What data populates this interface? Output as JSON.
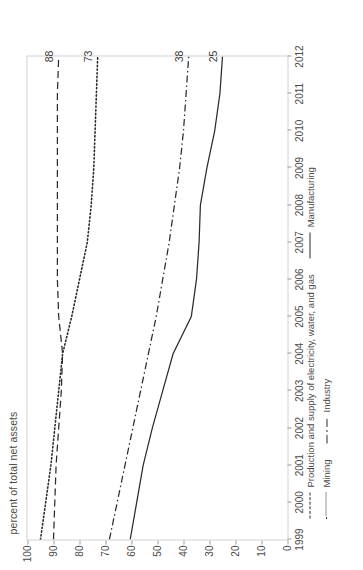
{
  "chart_data": {
    "type": "line",
    "title": "",
    "subtitle": "",
    "xlabel": "",
    "ylabel": "percent of total net assets",
    "x": [
      1999,
      2000,
      2001,
      2002,
      2003,
      2004,
      2005,
      2006,
      2007,
      2008,
      2009,
      2010,
      2011,
      2012
    ],
    "xtick_labels": [
      "1999",
      "2000",
      "2001",
      "2002",
      "2003",
      "2004",
      "2005",
      "2006",
      "2007",
      "2008",
      "2009",
      "2010",
      "2011",
      "2012"
    ],
    "ylim": [
      0,
      100
    ],
    "ytick_labels": [
      "0",
      "10",
      "20",
      "30",
      "40",
      "50",
      "60",
      "70",
      "80",
      "90",
      "100"
    ],
    "ytick_values": [
      0,
      10,
      20,
      30,
      40,
      50,
      60,
      70,
      80,
      90,
      100
    ],
    "grid": false,
    "legend_position": "bottom",
    "series": [
      {
        "name": "Production and supply of electricity, water, and gas",
        "style": "dashed",
        "color": "#2b2b2b",
        "end_label": "88",
        "values": [
          90,
          89.5,
          89,
          88,
          87,
          86.5,
          88,
          88.5,
          88.5,
          88.5,
          88.5,
          88.5,
          88.5,
          88
        ]
      },
      {
        "name": "Mining",
        "style": "dotted",
        "color": "#2b2b2b",
        "end_label": "73",
        "values": [
          95,
          93,
          91,
          89.5,
          88,
          86.5,
          83,
          80,
          77,
          75.5,
          74.5,
          74,
          73.5,
          73
        ]
      },
      {
        "name": "Industry",
        "style": "dash-dot",
        "color": "#2b2b2b",
        "end_label": "38",
        "values": [
          68.5,
          65.5,
          62.5,
          59.5,
          56.5,
          53.5,
          50.5,
          48,
          45.5,
          43.5,
          41.5,
          40,
          39,
          38
        ]
      },
      {
        "name": "Manufacturing",
        "style": "solid",
        "color": "#2b2b2b",
        "end_label": "25",
        "values": [
          60.5,
          58,
          55.5,
          52,
          48,
          44,
          37,
          35,
          34,
          33.5,
          31,
          28,
          26,
          25
        ]
      }
    ]
  }
}
